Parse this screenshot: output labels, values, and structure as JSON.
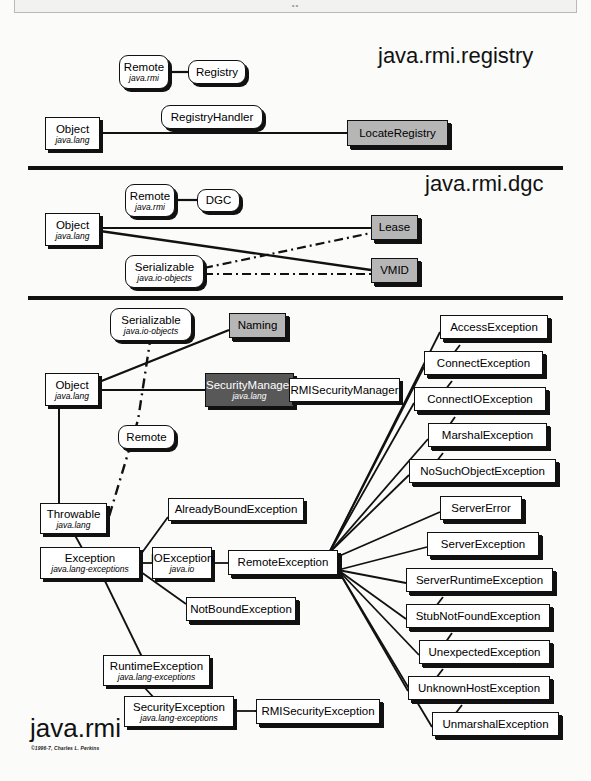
{
  "document": {
    "title": "java.rmi",
    "copyright": "©1996-7, Charles L. Perkins",
    "top_strip_dots": "••"
  },
  "colors": {
    "page_background": "#fbfbfa",
    "line": "#111111",
    "box_fill": "#ffffff",
    "gray_fill": "#b6b6b6",
    "dark_fill": "#585858",
    "dark_text": "#ffffff"
  },
  "sections": [
    {
      "id": "registry",
      "title": "java.rmi.registry",
      "nodes": [
        {
          "id": "reg-remote",
          "name": "Remote",
          "package": "java.rmi",
          "shape": "interface",
          "fill": "white"
        },
        {
          "id": "reg-registry",
          "name": "Registry",
          "package": "",
          "shape": "interface",
          "fill": "white"
        },
        {
          "id": "reg-handler",
          "name": "RegistryHandler",
          "package": "",
          "shape": "interface",
          "fill": "white"
        },
        {
          "id": "reg-object",
          "name": "Object",
          "package": "java.lang",
          "shape": "class",
          "fill": "white"
        },
        {
          "id": "reg-locate",
          "name": "LocateRegistry",
          "package": "",
          "shape": "class",
          "fill": "gray"
        }
      ],
      "edges": [
        {
          "from": "reg-remote",
          "to": "reg-registry",
          "style": "solid"
        },
        {
          "from": "reg-object",
          "to": "reg-locate",
          "style": "solid"
        }
      ]
    },
    {
      "id": "dgc",
      "title": "java.rmi.dgc",
      "nodes": [
        {
          "id": "dgc-remote",
          "name": "Remote",
          "package": "java.rmi",
          "shape": "interface",
          "fill": "white"
        },
        {
          "id": "dgc-dgc",
          "name": "DGC",
          "package": "",
          "shape": "interface",
          "fill": "white"
        },
        {
          "id": "dgc-object",
          "name": "Object",
          "package": "java.lang",
          "shape": "class",
          "fill": "white"
        },
        {
          "id": "dgc-ser",
          "name": "Serializable",
          "package": "java.io-objects",
          "shape": "interface",
          "fill": "white"
        },
        {
          "id": "dgc-lease",
          "name": "Lease",
          "package": "",
          "shape": "class",
          "fill": "gray"
        },
        {
          "id": "dgc-vmid",
          "name": "VMID",
          "package": "",
          "shape": "class",
          "fill": "gray"
        }
      ],
      "edges": [
        {
          "from": "dgc-remote",
          "to": "dgc-dgc",
          "style": "solid"
        },
        {
          "from": "dgc-object",
          "to": "dgc-lease",
          "style": "solid"
        },
        {
          "from": "dgc-object",
          "to": "dgc-vmid",
          "style": "solid"
        },
        {
          "from": "dgc-ser",
          "to": "dgc-lease",
          "style": "dashdot"
        },
        {
          "from": "dgc-ser",
          "to": "dgc-vmid",
          "style": "dashdot"
        }
      ]
    },
    {
      "id": "rmi",
      "title": "java.rmi",
      "nodes": [
        {
          "id": "rmi-ser",
          "name": "Serializable",
          "package": "java.io-objects",
          "shape": "interface",
          "fill": "white"
        },
        {
          "id": "rmi-naming",
          "name": "Naming",
          "package": "",
          "shape": "class",
          "fill": "gray"
        },
        {
          "id": "rmi-object",
          "name": "Object",
          "package": "java.lang",
          "shape": "class",
          "fill": "white"
        },
        {
          "id": "rmi-secmgr",
          "name": "SecurityManager",
          "package": "java.lang",
          "shape": "class",
          "fill": "dark"
        },
        {
          "id": "rmi-rmisec",
          "name": "RMISecurityManager",
          "package": "",
          "shape": "class",
          "fill": "white"
        },
        {
          "id": "rmi-remote",
          "name": "Remote",
          "package": "",
          "shape": "interface",
          "fill": "white"
        },
        {
          "id": "rmi-throwable",
          "name": "Throwable",
          "package": "java.lang",
          "shape": "class",
          "fill": "white"
        },
        {
          "id": "rmi-exception",
          "name": "Exception",
          "package": "java.lang-exceptions",
          "shape": "class",
          "fill": "white"
        },
        {
          "id": "rmi-ioexc",
          "name": "IOException",
          "package": "java.io",
          "shape": "class",
          "fill": "white"
        },
        {
          "id": "rmi-remoteexc",
          "name": "RemoteException",
          "package": "",
          "shape": "class",
          "fill": "white"
        },
        {
          "id": "rmi-already",
          "name": "AlreadyBoundException",
          "package": "",
          "shape": "class",
          "fill": "white"
        },
        {
          "id": "rmi-notbound",
          "name": "NotBoundException",
          "package": "",
          "shape": "class",
          "fill": "white"
        },
        {
          "id": "rmi-runtime",
          "name": "RuntimeException",
          "package": "java.lang-exceptions",
          "shape": "class",
          "fill": "white"
        },
        {
          "id": "rmi-secexc",
          "name": "SecurityException",
          "package": "java.lang-exceptions",
          "shape": "class",
          "fill": "white"
        },
        {
          "id": "rmi-rmisecexc",
          "name": "RMISecurityException",
          "package": "",
          "shape": "class",
          "fill": "white"
        },
        {
          "id": "exc-access",
          "name": "AccessException",
          "package": "",
          "shape": "class",
          "fill": "white"
        },
        {
          "id": "exc-connect",
          "name": "ConnectException",
          "package": "",
          "shape": "class",
          "fill": "white"
        },
        {
          "id": "exc-connectio",
          "name": "ConnectIOException",
          "package": "",
          "shape": "class",
          "fill": "white"
        },
        {
          "id": "exc-marshal",
          "name": "MarshalException",
          "package": "",
          "shape": "class",
          "fill": "white"
        },
        {
          "id": "exc-nosuch",
          "name": "NoSuchObjectException",
          "package": "",
          "shape": "class",
          "fill": "white"
        },
        {
          "id": "exc-servererr",
          "name": "ServerError",
          "package": "",
          "shape": "class",
          "fill": "white"
        },
        {
          "id": "exc-server",
          "name": "ServerException",
          "package": "",
          "shape": "class",
          "fill": "white"
        },
        {
          "id": "exc-srvrt",
          "name": "ServerRuntimeException",
          "package": "",
          "shape": "class",
          "fill": "white"
        },
        {
          "id": "exc-stub",
          "name": "StubNotFoundException",
          "package": "",
          "shape": "class",
          "fill": "white"
        },
        {
          "id": "exc-unexp",
          "name": "UnexpectedException",
          "package": "",
          "shape": "class",
          "fill": "white"
        },
        {
          "id": "exc-unkhost",
          "name": "UnknownHostException",
          "package": "",
          "shape": "class",
          "fill": "white"
        },
        {
          "id": "exc-unmarshal",
          "name": "UnmarshalException",
          "package": "",
          "shape": "class",
          "fill": "white"
        }
      ],
      "edges": [
        {
          "from": "rmi-object",
          "to": "rmi-naming",
          "style": "solid"
        },
        {
          "from": "rmi-object",
          "to": "rmi-secmgr",
          "style": "solid"
        },
        {
          "from": "rmi-secmgr",
          "to": "rmi-rmisec",
          "style": "solid"
        },
        {
          "from": "rmi-ser",
          "to": "rmi-rmisecexc",
          "style": "dashdot"
        },
        {
          "from": "rmi-object",
          "to": "rmi-throwable",
          "style": "solid"
        },
        {
          "from": "rmi-throwable",
          "to": "rmi-exception",
          "style": "solid"
        },
        {
          "from": "rmi-exception",
          "to": "rmi-ioexc",
          "style": "solid"
        },
        {
          "from": "rmi-exception",
          "to": "rmi-already",
          "style": "solid"
        },
        {
          "from": "rmi-exception",
          "to": "rmi-notbound",
          "style": "solid"
        },
        {
          "from": "rmi-exception",
          "to": "rmi-runtime",
          "style": "solid"
        },
        {
          "from": "rmi-ioexc",
          "to": "rmi-remoteexc",
          "style": "solid"
        },
        {
          "from": "rmi-runtime",
          "to": "rmi-secexc",
          "style": "solid"
        },
        {
          "from": "rmi-secexc",
          "to": "rmi-rmisecexc",
          "style": "solid"
        },
        {
          "from": "rmi-remoteexc",
          "to": "exc-access",
          "style": "solid"
        },
        {
          "from": "rmi-remoteexc",
          "to": "exc-connect",
          "style": "solid"
        },
        {
          "from": "rmi-remoteexc",
          "to": "exc-connectio",
          "style": "solid"
        },
        {
          "from": "rmi-remoteexc",
          "to": "exc-marshal",
          "style": "solid"
        },
        {
          "from": "rmi-remoteexc",
          "to": "exc-nosuch",
          "style": "solid"
        },
        {
          "from": "rmi-remoteexc",
          "to": "exc-servererr",
          "style": "solid"
        },
        {
          "from": "rmi-remoteexc",
          "to": "exc-server",
          "style": "solid"
        },
        {
          "from": "rmi-remoteexc",
          "to": "exc-srvrt",
          "style": "solid"
        },
        {
          "from": "rmi-remoteexc",
          "to": "exc-stub",
          "style": "solid"
        },
        {
          "from": "rmi-remoteexc",
          "to": "exc-unexp",
          "style": "solid"
        },
        {
          "from": "rmi-remoteexc",
          "to": "exc-unkhost",
          "style": "solid"
        },
        {
          "from": "rmi-remoteexc",
          "to": "exc-unmarshal",
          "style": "solid"
        }
      ]
    }
  ]
}
